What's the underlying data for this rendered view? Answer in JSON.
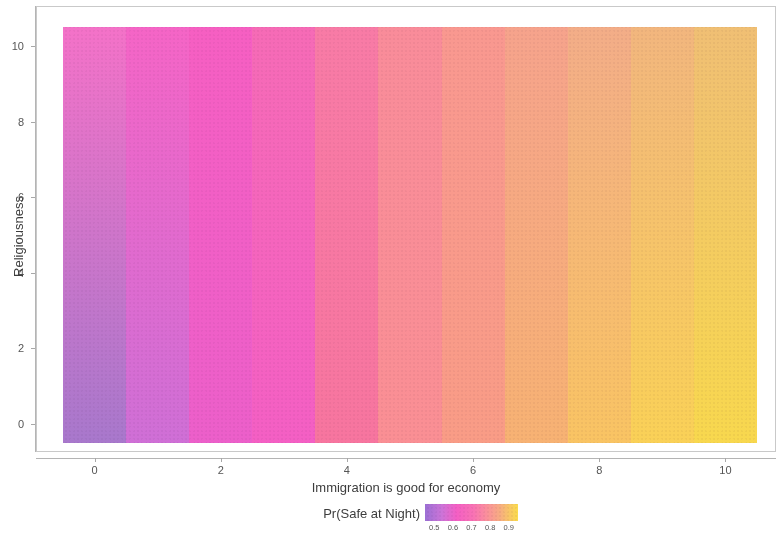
{
  "chart_data": {
    "type": "heatmap",
    "title": "",
    "xlabel": "Immigration is good for economy",
    "ylabel": "Religiousness",
    "legend_title": "Pr(Safe at Night)",
    "legend_position": "bottom",
    "grid": false,
    "xlim": [
      -0.5,
      10.5
    ],
    "ylim": [
      -0.5,
      10.5
    ],
    "x_ticks": [
      0,
      2,
      4,
      6,
      8,
      10
    ],
    "y_ticks": [
      0,
      2,
      4,
      6,
      8,
      10
    ],
    "x_tick_labels": [
      "0",
      "2",
      "4",
      "6",
      "8",
      "10"
    ],
    "y_tick_labels": [
      "0",
      "2",
      "4",
      "6",
      "8",
      "10"
    ],
    "legend_ticks": [
      0.5,
      0.6,
      0.7,
      0.8,
      0.9
    ],
    "legend_tick_labels": [
      "0.5",
      "0.6",
      "0.7",
      "0.8",
      "0.9"
    ],
    "colorscale": [
      {
        "stop": 0.0,
        "color": "#9b6fd4"
      },
      {
        "stop": 0.18,
        "color": "#cc74d8"
      },
      {
        "stop": 0.34,
        "color": "#f45fc4"
      },
      {
        "stop": 0.52,
        "color": "#f872b4"
      },
      {
        "stop": 0.66,
        "color": "#fa8f9c"
      },
      {
        "stop": 0.8,
        "color": "#f7ab83"
      },
      {
        "stop": 0.9,
        "color": "#f8c568"
      },
      {
        "stop": 1.0,
        "color": "#fbdc4e"
      }
    ],
    "x_categories": [
      0,
      1,
      2,
      3,
      4,
      5,
      6,
      7,
      8,
      9,
      10
    ],
    "column_value_bottom": [
      0.49,
      0.55,
      0.58,
      0.6,
      0.65,
      0.71,
      0.76,
      0.82,
      0.87,
      0.91,
      0.94
    ],
    "column_value_top": [
      0.57,
      0.58,
      0.59,
      0.61,
      0.64,
      0.67,
      0.7,
      0.73,
      0.76,
      0.79,
      0.81
    ],
    "column_colors_bottom": [
      "#a878cc",
      "#cf6fd6",
      "#ec5fca",
      "#f45fc4",
      "#f7759f",
      "#fa8f94",
      "#f99c86",
      "#f7b273",
      "#f9c463",
      "#fad157",
      "#f8d84e"
    ],
    "column_colors_top": [
      "#f472c8",
      "#f565c6",
      "#f65fc2",
      "#f66bb6",
      "#f87ba6",
      "#f98c9a",
      "#f99890",
      "#f6a38c",
      "#f3ad88",
      "#f2b67e",
      "#f0bf74"
    ]
  },
  "axes": {
    "x_title": "Immigration is good for economy",
    "y_title": "Religiousness"
  },
  "legend": {
    "title": "Pr(Safe at Night)"
  }
}
